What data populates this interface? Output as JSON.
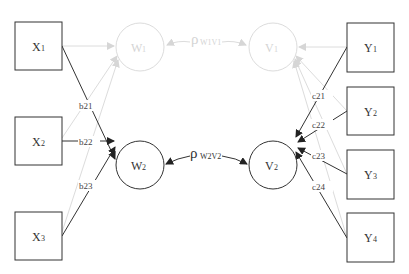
{
  "diagram": {
    "type": "structural equation path diagram",
    "colors": {
      "active": "#333333",
      "faded": "#d9d9d9",
      "background": "#ffffff"
    },
    "observed_left": [
      {
        "id": "X1",
        "base": "X",
        "sub": "1"
      },
      {
        "id": "X2",
        "base": "X",
        "sub": "2"
      },
      {
        "id": "X3",
        "base": "X",
        "sub": "3"
      }
    ],
    "latent_left": [
      {
        "id": "W1",
        "base": "W",
        "sub": "1",
        "faded": true
      },
      {
        "id": "W2",
        "base": "W",
        "sub": "2",
        "faded": false
      }
    ],
    "latent_right": [
      {
        "id": "V1",
        "base": "V",
        "sub": "1",
        "faded": true
      },
      {
        "id": "V2",
        "base": "V",
        "sub": "2",
        "faded": false
      }
    ],
    "observed_right": [
      {
        "id": "Y1",
        "base": "Y",
        "sub": "1"
      },
      {
        "id": "Y2",
        "base": "Y",
        "sub": "2"
      },
      {
        "id": "Y3",
        "base": "Y",
        "sub": "3"
      },
      {
        "id": "Y4",
        "base": "Y",
        "sub": "4"
      }
    ],
    "correlations": [
      {
        "id": "rho_w1v1",
        "symbol": "ρ",
        "sub": "W1V1",
        "faded": true
      },
      {
        "id": "rho_w2v2",
        "symbol": "ρ",
        "sub": "W2V2",
        "faded": false
      }
    ],
    "weights_left": [
      {
        "from": "X1",
        "to": "W2",
        "label": "b21"
      },
      {
        "from": "X2",
        "to": "W2",
        "label": "b22"
      },
      {
        "from": "X3",
        "to": "W2",
        "label": "b23"
      }
    ],
    "weights_right": [
      {
        "from": "Y1",
        "to": "V2",
        "label": "c21"
      },
      {
        "from": "Y2",
        "to": "V2",
        "label": "c22"
      },
      {
        "from": "Y3",
        "to": "V2",
        "label": "c23"
      },
      {
        "from": "Y4",
        "to": "V2",
        "label": "c24"
      }
    ]
  }
}
